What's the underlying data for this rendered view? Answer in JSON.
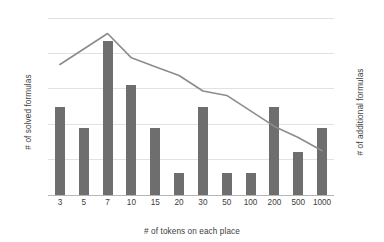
{
  "chart_data": {
    "type": "bar",
    "title": "",
    "subtitle": "",
    "xlabel": "# of tokens on each place",
    "ylabel": "# of solved formulas",
    "y2label": "# of additional formulas",
    "categories": [
      "3",
      "5",
      "7",
      "10",
      "15",
      "20",
      "30",
      "50",
      "100",
      "200",
      "500",
      "1000"
    ],
    "ylim": [
      0,
      250
    ],
    "y2lim": [
      0,
      8
    ],
    "yticks": [
      "0",
      "50",
      "100",
      "150",
      "200",
      "250"
    ],
    "ytick_values": [
      0,
      50,
      100,
      150,
      200,
      250
    ],
    "y2ticks": [
      "0",
      "1",
      "2",
      "3",
      "4",
      "5",
      "6",
      "7",
      "8"
    ],
    "y2tick_values": [
      0,
      1,
      2,
      3,
      4,
      5,
      6,
      7,
      8
    ],
    "grid": true,
    "legend": "none",
    "series": [
      {
        "name": "# of solved formulas",
        "type": "bar",
        "axis": "left",
        "color": "#6e6e6e",
        "values": [
          125,
          94,
          217,
          156,
          94,
          31,
          125,
          31,
          31,
          125,
          61,
          94
        ]
      },
      {
        "name": "# of additional formulas",
        "type": "line",
        "axis": "right",
        "color": "#8c8c8c",
        "values": [
          5.9,
          6.6,
          7.3,
          6.2,
          5.8,
          5.4,
          4.7,
          4.5,
          3.8,
          3.1,
          2.6,
          2.0
        ]
      }
    ]
  },
  "colors": {
    "bar": "#6e6e6e",
    "line": "#8c8c8c",
    "gridline": "#e2e2e2",
    "axis": "#b5b5b5",
    "text": "#404040",
    "background": "#ffffff"
  }
}
